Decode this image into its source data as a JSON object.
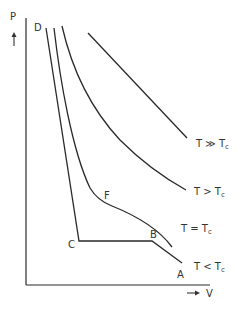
{
  "diagram": {
    "axes": {
      "y_label": "P",
      "x_label": "V",
      "y_arrow": "↑",
      "x_arrow": "→"
    },
    "points": {
      "A": "A",
      "B": "B",
      "C": "C",
      "D": "D",
      "F": "F"
    },
    "isotherms": [
      {
        "id": "t-less-tc",
        "label_main": "T < T",
        "label_sub": "c"
      },
      {
        "id": "t-equal-tc",
        "label_main": "T = T",
        "label_sub": "c"
      },
      {
        "id": "t-greater-tc",
        "label_main": "T > T",
        "label_sub": "c"
      },
      {
        "id": "t-much-greater-tc",
        "label_main": "T ≫ T",
        "label_sub": "c"
      }
    ],
    "colors": {
      "line": "#2a2a2a",
      "text": "#333333",
      "background": "#ffffff"
    }
  }
}
